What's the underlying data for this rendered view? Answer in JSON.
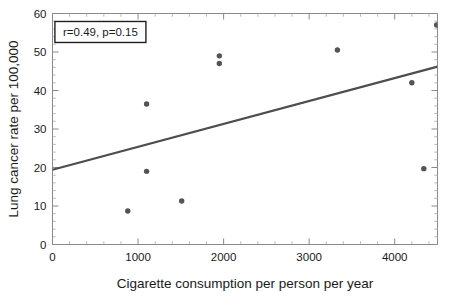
{
  "chart_data": {
    "type": "scatter",
    "title": "",
    "xlabel": "Cigarette consumption per person per year",
    "ylabel": "Lung cancer rate per 100,000",
    "xlim": [
      0,
      4500
    ],
    "ylim": [
      0,
      60
    ],
    "grid": false,
    "legend": null,
    "x_ticks": [
      0,
      1000,
      2000,
      3000,
      4000
    ],
    "x_tick_labels": [
      "0",
      "1000",
      "2000",
      "3000",
      "4000"
    ],
    "x_minor_tick_step": 200,
    "y_ticks": [
      0,
      10,
      20,
      30,
      40,
      50,
      60
    ],
    "y_tick_labels": [
      "0",
      "10",
      "20",
      "30",
      "40",
      "50",
      "60"
    ],
    "y_minor_tick_step": 2,
    "points": [
      {
        "x": 880,
        "y": 8.7
      },
      {
        "x": 1100,
        "y": 19.0
      },
      {
        "x": 1100,
        "y": 36.5
      },
      {
        "x": 1510,
        "y": 11.3
      },
      {
        "x": 1950,
        "y": 49.0
      },
      {
        "x": 1950,
        "y": 47.0
      },
      {
        "x": 3330,
        "y": 50.5
      },
      {
        "x": 4200,
        "y": 42.0
      },
      {
        "x": 4340,
        "y": 19.7
      },
      {
        "x": 4490,
        "y": 57.0
      }
    ],
    "marker_color": "#545454",
    "marker_size_px": 4.2,
    "trend_line": {
      "x_start": 0,
      "y_start": 19.4,
      "x_end": 4500,
      "y_end": 46.2,
      "color": "#4d4d4d"
    },
    "annotations": [
      {
        "name": "correlation-stats",
        "text": "r=0.49, p=0.15",
        "x": 560,
        "y": 55.2,
        "boxed": true
      }
    ]
  },
  "axes": {
    "x_title": "Cigarette consumption per person per year",
    "y_title": "Lung cancer rate per 100,000"
  },
  "annotation": {
    "stats_label": "r=0.49, p=0.15"
  },
  "colors": {
    "marker": "#545454",
    "trend": "#4d4d4d",
    "axis": "#8a8a8a",
    "text": "#1a1a1a",
    "background": "#ffffff"
  }
}
